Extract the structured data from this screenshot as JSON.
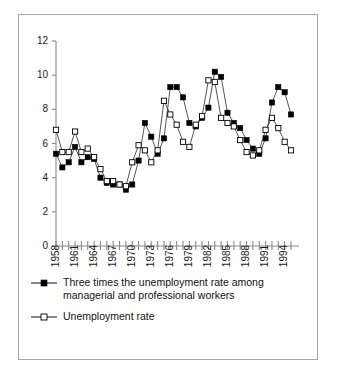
{
  "chart_data": {
    "type": "line",
    "title": "",
    "xlabel": "",
    "ylabel": "",
    "ylim": [
      0,
      12
    ],
    "yticks": [
      0,
      2,
      4,
      6,
      8,
      10,
      12
    ],
    "grid": false,
    "legend_position": "below-axes-left",
    "x": [
      1958,
      1959,
      1960,
      1961,
      1962,
      1963,
      1964,
      1965,
      1966,
      1967,
      1968,
      1969,
      1970,
      1971,
      1972,
      1973,
      1974,
      1975,
      1976,
      1977,
      1978,
      1979,
      1980,
      1981,
      1982,
      1983,
      1984,
      1985,
      1986,
      1987,
      1988,
      1989,
      1990,
      1991,
      1992,
      1993,
      1994,
      1995
    ],
    "xtick_labels": [
      "1958",
      "1961",
      "1964",
      "1967",
      "1970",
      "1973",
      "1976",
      "1979",
      "1982",
      "1985",
      "1988",
      "1991",
      "1994"
    ],
    "xtick_values": [
      1958,
      1961,
      1964,
      1967,
      1970,
      1973,
      1976,
      1979,
      1982,
      1985,
      1988,
      1991,
      1994
    ],
    "series": [
      {
        "name": "Three times the unemployment rate among managerial and professional workers",
        "marker": "filled-square",
        "color": "#000000",
        "values": [
          5.4,
          4.6,
          4.9,
          5.8,
          4.9,
          5.2,
          5.1,
          4.0,
          3.7,
          3.6,
          3.6,
          3.3,
          3.6,
          5.0,
          7.2,
          6.4,
          5.4,
          6.3,
          9.3,
          9.3,
          8.7,
          7.2,
          7.0,
          7.5,
          8.1,
          10.2,
          9.9,
          7.8,
          7.2,
          6.9,
          6.2,
          5.7,
          5.4,
          6.3,
          8.4,
          9.3,
          9.0,
          7.7
        ]
      },
      {
        "name": "Unemployment rate",
        "marker": "open-square",
        "color": "#ffffff",
        "values": [
          6.8,
          5.5,
          5.5,
          6.7,
          5.5,
          5.7,
          5.2,
          4.5,
          3.8,
          3.8,
          3.6,
          3.5,
          4.9,
          5.9,
          5.6,
          4.9,
          5.6,
          8.5,
          7.7,
          7.1,
          6.1,
          5.8,
          7.1,
          7.6,
          9.7,
          9.6,
          7.5,
          7.2,
          7.0,
          6.2,
          5.5,
          5.3,
          5.6,
          6.8,
          7.5,
          6.9,
          6.1,
          5.6
        ]
      }
    ],
    "last_point_filled": 7.1,
    "last_point_open": 5.5
  },
  "legend": {
    "entries": [
      {
        "marker": "filled-square-marker",
        "line1": "Three times the unemployment rate among",
        "line2": "managerial and professional workers"
      },
      {
        "marker": "open-square-marker",
        "line1": "Unemployment rate",
        "line2": ""
      }
    ]
  }
}
